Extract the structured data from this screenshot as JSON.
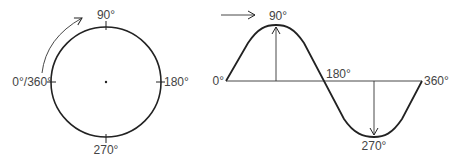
{
  "circle_diagram": {
    "labels": {
      "top": "90°",
      "right": "180°",
      "bottom": "270°",
      "left": "0°/360°"
    },
    "rotation_arrow": "counterclockwise-start-arrow"
  },
  "sine_diagram": {
    "labels": {
      "start": "0°",
      "peak": "90°",
      "mid": "180°",
      "trough": "270°",
      "end": "360°"
    },
    "direction_arrow": "right-arrow"
  },
  "colors": {
    "stroke": "#222222",
    "text": "#444444"
  }
}
